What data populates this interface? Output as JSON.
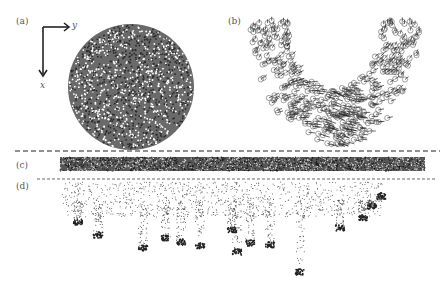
{
  "figure": {
    "panels": [
      {
        "id": "a",
        "label": "(a)",
        "description": "circular particle ensemble, initial state"
      },
      {
        "id": "b",
        "label": "(b)",
        "description": "velocity vectors of particles in U-shaped region"
      },
      {
        "id": "c",
        "label": "(c)",
        "description": "dense particle strip"
      },
      {
        "id": "d",
        "label": "(d)",
        "description": "particle fingering / dripping instabilities"
      }
    ],
    "axes": {
      "x_label": "x",
      "y_label": "y"
    },
    "colors": {
      "ink": "#222222",
      "particle": "#3a3a3a",
      "background": "#ffffff"
    }
  }
}
